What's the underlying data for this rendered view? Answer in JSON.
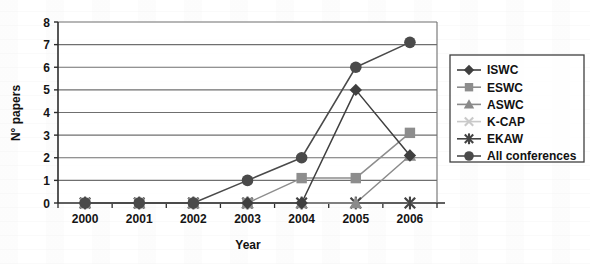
{
  "chart_data": {
    "type": "line",
    "title": "",
    "xlabel": "Year",
    "ylabel": "N° papers",
    "categories": [
      "2000",
      "2001",
      "2002",
      "2003",
      "2004",
      "2005",
      "2006"
    ],
    "ylim": [
      0,
      8
    ],
    "yticks": [
      0,
      1,
      2,
      3,
      4,
      5,
      6,
      7,
      8
    ],
    "grid": true,
    "legend_position": "right",
    "series": [
      {
        "name": "ISWC",
        "marker": "diamond",
        "color": "#3f3f3f",
        "values": [
          0,
          0,
          0,
          0,
          0,
          5,
          2.1
        ]
      },
      {
        "name": "ESWC",
        "marker": "square",
        "color": "#8d8d8d",
        "values": [
          0,
          0,
          0,
          0,
          1.1,
          1.1,
          3.1
        ]
      },
      {
        "name": "ASWC",
        "marker": "triangle",
        "color": "#8a8a8a",
        "values": [
          0,
          0,
          0,
          0,
          0,
          0,
          2.1
        ]
      },
      {
        "name": "K-CAP",
        "marker": "x",
        "color": "#c9c9c9",
        "values": [
          0,
          0,
          0,
          0,
          0,
          0,
          0
        ]
      },
      {
        "name": "EKAW",
        "marker": "asterisk",
        "color": "#434343",
        "values": [
          0,
          0,
          0,
          0,
          0,
          0,
          0
        ]
      },
      {
        "name": "All conferences",
        "marker": "circle",
        "color": "#4a4a4a",
        "values": [
          0,
          0,
          0,
          1,
          2,
          6,
          7.1
        ]
      }
    ]
  },
  "axis": {
    "y_tick_labels": [
      "0",
      "1",
      "2",
      "3",
      "4",
      "5",
      "6",
      "7",
      "8"
    ],
    "x_tick_labels": [
      "2000",
      "2001",
      "2002",
      "2003",
      "2004",
      "2005",
      "2006"
    ],
    "y_title": "N° papers",
    "x_title": "Year"
  },
  "legend": {
    "entries": [
      "ISWC",
      "ESWC",
      "ASWC",
      "K-CAP",
      "EKAW",
      "All conferences"
    ]
  },
  "colors": {
    "axis": "#2b2b2b",
    "grid": "#6f6f6f",
    "plot_background": "#ffffff",
    "legend_border": "#2b2b2b"
  }
}
